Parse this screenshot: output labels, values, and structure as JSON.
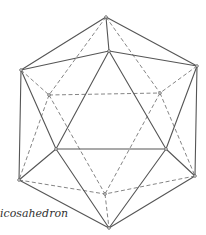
{
  "figure": {
    "label": "icosahedron",
    "vertices": {
      "top": [
        106,
        17
      ],
      "upper_center": [
        109,
        51
      ],
      "upper_left": [
        21,
        70
      ],
      "upper_right": [
        197,
        66
      ],
      "back_upper_left": [
        49,
        95
      ],
      "back_upper_right": [
        160,
        93
      ],
      "lower_left_front": [
        56,
        149
      ],
      "lower_right_front": [
        166,
        149
      ],
      "far_lower_left": [
        19,
        180
      ],
      "far_lower_right": [
        195,
        176
      ],
      "back_lower_center": [
        105,
        194
      ],
      "bottom": [
        109,
        228
      ]
    },
    "solid_edges": [
      [
        "top",
        "upper_left"
      ],
      [
        "top",
        "upper_right"
      ],
      [
        "top",
        "upper_center"
      ],
      [
        "upper_center",
        "upper_left"
      ],
      [
        "upper_center",
        "upper_right"
      ],
      [
        "upper_left",
        "far_lower_left"
      ],
      [
        "upper_right",
        "far_lower_right"
      ],
      [
        "upper_left",
        "lower_left_front"
      ],
      [
        "upper_right",
        "lower_right_front"
      ],
      [
        "upper_center",
        "lower_left_front"
      ],
      [
        "upper_center",
        "lower_right_front"
      ],
      [
        "lower_left_front",
        "lower_right_front"
      ],
      [
        "lower_left_front",
        "far_lower_left"
      ],
      [
        "lower_right_front",
        "far_lower_right"
      ],
      [
        "far_lower_left",
        "bottom"
      ],
      [
        "far_lower_right",
        "bottom"
      ],
      [
        "lower_left_front",
        "bottom"
      ],
      [
        "lower_right_front",
        "bottom"
      ]
    ],
    "dashed_edges": [
      [
        "top",
        "back_upper_left"
      ],
      [
        "top",
        "back_upper_right"
      ],
      [
        "back_upper_left",
        "back_upper_right"
      ],
      [
        "upper_left",
        "back_upper_left"
      ],
      [
        "upper_right",
        "back_upper_right"
      ],
      [
        "back_upper_left",
        "far_lower_left"
      ],
      [
        "back_upper_right",
        "far_lower_right"
      ],
      [
        "back_upper_left",
        "back_lower_center"
      ],
      [
        "back_upper_right",
        "back_lower_center"
      ],
      [
        "far_lower_left",
        "back_lower_center"
      ],
      [
        "far_lower_right",
        "back_lower_center"
      ],
      [
        "back_lower_center",
        "bottom"
      ]
    ],
    "colors": {
      "solid": "#555555",
      "dashed": "#777777",
      "background": "#ffffff"
    }
  }
}
